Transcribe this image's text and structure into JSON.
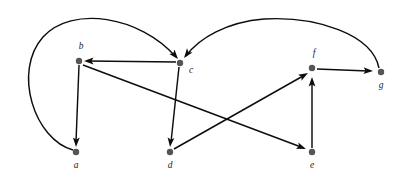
{
  "figure": {
    "type": "directed-graph",
    "title": "",
    "background_color": "#ffffff",
    "node_color": "#555555",
    "edge_color": "#0d0d0d",
    "label_color": "#222222",
    "node_radius": 3.2,
    "width": 399,
    "height": 178
  },
  "nodes": [
    {
      "id": "a",
      "label": "a",
      "x": 76,
      "y": 152,
      "label_x": 76,
      "label_y": 166,
      "label_anchor": "middle"
    },
    {
      "id": "b",
      "label": "b",
      "x": 79,
      "y": 61,
      "label_x": 81,
      "label_y": 47,
      "label_anchor": "middle"
    },
    {
      "id": "c",
      "label": "c",
      "x": 180,
      "y": 63,
      "label_x": 189,
      "label_y": 71,
      "label_anchor": "start"
    },
    {
      "id": "d",
      "label": "d",
      "x": 170,
      "y": 152,
      "label_x": 170,
      "label_y": 166,
      "label_anchor": "middle"
    },
    {
      "id": "e",
      "label": "e",
      "x": 312,
      "y": 152,
      "label_x": 312,
      "label_y": 166,
      "label_anchor": "middle"
    },
    {
      "id": "f",
      "label": "f",
      "x": 312,
      "y": 68,
      "label_x": 314,
      "label_y": 54,
      "label_anchor": "middle"
    },
    {
      "id": "g",
      "label": "g",
      "x": 381,
      "y": 72,
      "label_x": 381,
      "label_y": 86,
      "label_anchor": "middle"
    }
  ],
  "edges": [
    {
      "id": "a-c",
      "from": "a",
      "to": "c",
      "shape": "curved",
      "directed": true,
      "path": "M 73 150 C 35 140 12 72 43 37 C 72 5 140 16 176 57",
      "arrow": {
        "x": 178,
        "y": 59,
        "angle": 50
      }
    },
    {
      "id": "g-c",
      "from": "g",
      "to": "c",
      "shape": "curved",
      "directed": true,
      "path": "M 379 68 C 372 34 316 16 264 19 C 227 22 199 38 186 56",
      "arrow": {
        "x": 184,
        "y": 58,
        "angle": 127
      }
    },
    {
      "id": "c-b",
      "from": "c",
      "to": "b",
      "shape": "straight",
      "directed": true,
      "path": "M 176 62 L 88 61",
      "arrow": {
        "x": 84,
        "y": 61,
        "angle": 180
      }
    },
    {
      "id": "b-a",
      "from": "b",
      "to": "a",
      "shape": "straight",
      "directed": true,
      "path": "M 79 65 L 76 142",
      "arrow": {
        "x": 76,
        "y": 147,
        "angle": 92
      }
    },
    {
      "id": "c-d",
      "from": "c",
      "to": "d",
      "shape": "straight",
      "directed": true,
      "path": "M 179 67 L 171 142",
      "arrow": {
        "x": 170,
        "y": 147,
        "angle": 96
      }
    },
    {
      "id": "b-e",
      "from": "b",
      "to": "e",
      "shape": "straight",
      "directed": true,
      "path": "M 83 65 L 301 147",
      "arrow": {
        "x": 306,
        "y": 149,
        "angle": 21
      }
    },
    {
      "id": "d-f",
      "from": "d",
      "to": "f",
      "shape": "straight",
      "directed": true,
      "path": "M 174 149 L 303 76",
      "arrow": {
        "x": 308,
        "y": 73,
        "angle": -30
      }
    },
    {
      "id": "e-f",
      "from": "e",
      "to": "f",
      "shape": "straight",
      "directed": true,
      "path": "M 312 148 L 312 82",
      "arrow": {
        "x": 312,
        "y": 77,
        "angle": -90
      }
    },
    {
      "id": "f-g",
      "from": "f",
      "to": "g",
      "shape": "straight",
      "directed": true,
      "path": "M 317 69 L 368 71",
      "arrow": {
        "x": 373,
        "y": 71,
        "angle": 2
      }
    }
  ]
}
